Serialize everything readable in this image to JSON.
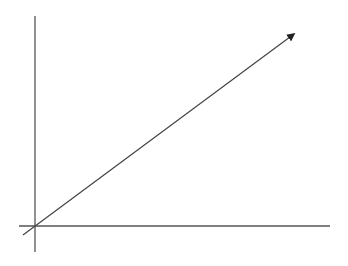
{
  "diagram": {
    "type": "axes-with-diagonal-arrow",
    "background": "#ffffff",
    "stroke_color": "#555555",
    "arrow_color": "#222222",
    "vertical_axis": {
      "x": 35,
      "y1": 16,
      "y2": 252
    },
    "horizontal_axis": {
      "y": 226,
      "x1": 19,
      "x2": 330
    },
    "diagonal_arrow": {
      "x1": 23,
      "y1": 235,
      "x2": 294,
      "y2": 34
    }
  }
}
